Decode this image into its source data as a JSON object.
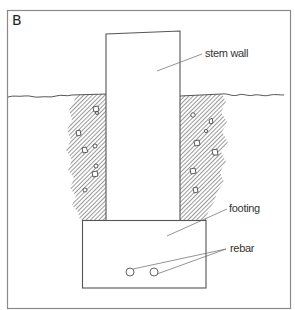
{
  "figure": {
    "panel_label": "B",
    "labels": {
      "stem_wall": "stem wall",
      "footing": "footing",
      "rebar": "rebar"
    },
    "colors": {
      "line": "#555555",
      "frame": "#888888",
      "soil_hatch": "#444444",
      "background": "#ffffff"
    },
    "rebar_count": 2
  }
}
